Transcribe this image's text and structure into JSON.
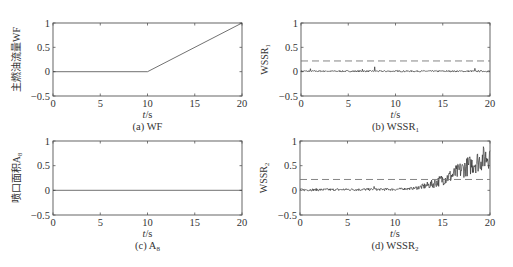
{
  "chart_data": [
    {
      "id": "a",
      "type": "line",
      "caption": "(a) WF",
      "ylabel": "主燃油流量WF",
      "xlabel": "t/s",
      "xlim": [
        0,
        20
      ],
      "ylim": [
        -0.5,
        1
      ],
      "xticks": [
        0,
        5,
        10,
        15,
        20
      ],
      "yticks": [
        -0.5,
        0,
        0.5,
        1
      ],
      "grid": false,
      "series": [
        {
          "name": "WF",
          "x": [
            0,
            10,
            20
          ],
          "y": [
            0,
            0,
            1
          ],
          "style": "solid"
        }
      ]
    },
    {
      "id": "b",
      "type": "line",
      "caption": "(b) WSSR1",
      "caption_main": "(b) WSSR",
      "caption_sub": "1",
      "ylabel": "WSSR",
      "ylabel_sub": "1",
      "xlabel": "t/s",
      "xlim": [
        0,
        20
      ],
      "ylim": [
        -0.5,
        1
      ],
      "xticks": [
        0,
        5,
        10,
        15,
        20
      ],
      "yticks": [
        -0.5,
        0,
        0.5,
        1
      ],
      "grid": false,
      "threshold": 0.22,
      "series": [
        {
          "name": "WSSR1",
          "noise_level": 0.03,
          "spikes": [
            [
              1,
              0.06
            ],
            [
              7.8,
              0.1
            ],
            [
              18.4,
              0.07
            ],
            [
              6.5,
              0.05
            ]
          ],
          "trend": "flat",
          "style": "solid"
        },
        {
          "name": "threshold",
          "y": 0.22,
          "style": "dashed"
        }
      ]
    },
    {
      "id": "c",
      "type": "line",
      "caption": "(c) A8",
      "caption_main": "(c) A",
      "caption_sub": "8",
      "ylabel": "喷口面积A",
      "ylabel_sub": "8",
      "xlabel": "t/s",
      "xlim": [
        0,
        20
      ],
      "ylim": [
        -0.5,
        1
      ],
      "xticks": [
        0,
        5,
        10,
        15,
        20
      ],
      "yticks": [
        -0.5,
        0,
        0.5,
        1
      ],
      "grid": false,
      "series": [
        {
          "name": "A8",
          "x": [
            0,
            20
          ],
          "y": [
            0,
            0
          ],
          "style": "solid"
        }
      ]
    },
    {
      "id": "d",
      "type": "line",
      "caption": "(d) WSSR2",
      "caption_main": "(d) WSSR",
      "caption_sub": "2",
      "ylabel": "WSSR",
      "ylabel_sub": "2",
      "xlabel": "t/s",
      "xlim": [
        0,
        20
      ],
      "ylim": [
        -0.5,
        1
      ],
      "xticks": [
        0,
        5,
        10,
        15,
        20
      ],
      "yticks": [
        -0.5,
        0,
        0.5,
        1
      ],
      "grid": false,
      "threshold": 0.22,
      "series": [
        {
          "name": "WSSR2",
          "trend_points": [
            [
              0,
              0.01
            ],
            [
              10,
              0.02
            ],
            [
              12,
              0.04
            ],
            [
              13,
              0.08
            ],
            [
              14,
              0.13
            ],
            [
              15,
              0.22
            ],
            [
              16,
              0.3
            ],
            [
              17,
              0.42
            ],
            [
              18,
              0.52
            ],
            [
              19,
              0.62
            ],
            [
              20,
              0.72
            ]
          ],
          "noise_growth": true,
          "style": "solid"
        },
        {
          "name": "threshold",
          "y": 0.22,
          "style": "dashed"
        }
      ]
    }
  ],
  "layout": {
    "panels": {
      "a": {
        "left": 53,
        "right": 242,
        "top": 23,
        "bottom": 96
      },
      "b": {
        "left": 301,
        "right": 490,
        "top": 23,
        "bottom": 96
      },
      "c": {
        "left": 53,
        "right": 242,
        "top": 141,
        "bottom": 215
      },
      "d": {
        "left": 300,
        "right": 490,
        "top": 141,
        "bottom": 215
      }
    }
  }
}
